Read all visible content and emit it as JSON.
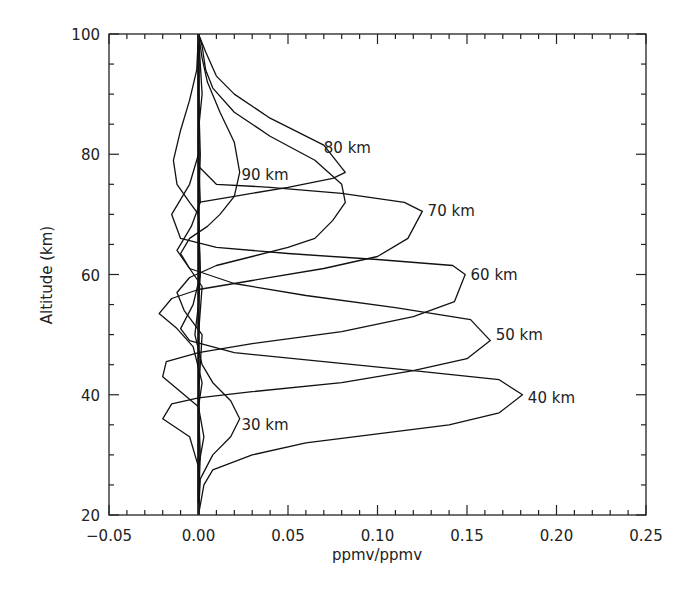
{
  "chart_data": {
    "type": "line",
    "title": "",
    "xlabel": "ppmv/ppmv",
    "ylabel": "Altitude (km)",
    "xlim": [
      -0.05,
      0.25
    ],
    "ylim": [
      20,
      100
    ],
    "grid": false,
    "legend": "none (inline curve labels)",
    "x_ticks": [
      "-0.05",
      "0.00",
      "0.05",
      "0.10",
      "0.15",
      "0.20",
      "0.25"
    ],
    "x_tick_values": [
      -0.05,
      0.0,
      0.05,
      0.1,
      0.15,
      0.2,
      0.25
    ],
    "y_ticks": [
      "20",
      "40",
      "60",
      "80",
      "100"
    ],
    "y_tick_values": [
      20,
      40,
      60,
      80,
      100
    ],
    "x_minor_step": 0.01,
    "y_minor_step": 5,
    "series": [
      {
        "name": "30 km",
        "label": "30 km",
        "label_pos": [
          0.024,
          35
        ],
        "points": [
          [
            0.0,
            20
          ],
          [
            0.001,
            26
          ],
          [
            0.008,
            30
          ],
          [
            0.018,
            33
          ],
          [
            0.023,
            36
          ],
          [
            0.018,
            39
          ],
          [
            0.008,
            42
          ],
          [
            0.002,
            45
          ],
          [
            -0.002,
            50
          ],
          [
            0.0,
            55
          ],
          [
            0.001,
            60
          ],
          [
            0.0,
            70
          ],
          [
            0.001,
            80
          ],
          [
            0.0,
            90
          ],
          [
            0.0,
            100
          ]
        ]
      },
      {
        "name": "40 km",
        "label": "40 km",
        "label_pos": [
          0.184,
          39.5
        ],
        "points": [
          [
            0.0,
            20
          ],
          [
            0.003,
            25
          ],
          [
            0.008,
            27.5
          ],
          [
            0.03,
            30
          ],
          [
            0.06,
            32
          ],
          [
            0.1,
            33.5
          ],
          [
            0.14,
            35
          ],
          [
            0.168,
            37
          ],
          [
            0.181,
            40
          ],
          [
            0.168,
            42.5
          ],
          [
            0.12,
            44
          ],
          [
            0.07,
            45.5
          ],
          [
            0.02,
            47
          ],
          [
            -0.005,
            49
          ],
          [
            -0.01,
            51
          ],
          [
            -0.003,
            55
          ],
          [
            0.001,
            60
          ],
          [
            0.0,
            70
          ],
          [
            0.0,
            80
          ],
          [
            0.0,
            100
          ]
        ]
      },
      {
        "name": "50 km",
        "label": "50 km",
        "label_pos": [
          0.166,
          50
        ],
        "points": [
          [
            0.0,
            22
          ],
          [
            0.0,
            28
          ],
          [
            -0.005,
            33
          ],
          [
            -0.02,
            36
          ],
          [
            -0.015,
            38.5
          ],
          [
            0.0,
            39.5
          ],
          [
            0.03,
            40.5
          ],
          [
            0.08,
            42
          ],
          [
            0.12,
            44
          ],
          [
            0.15,
            46
          ],
          [
            0.163,
            49
          ],
          [
            0.152,
            52.5
          ],
          [
            0.11,
            54.5
          ],
          [
            0.06,
            56.5
          ],
          [
            0.02,
            58.5
          ],
          [
            -0.005,
            61
          ],
          [
            -0.012,
            64
          ],
          [
            -0.004,
            68
          ],
          [
            0.001,
            72
          ],
          [
            0.0,
            80
          ],
          [
            0.0,
            100
          ]
        ]
      },
      {
        "name": "60 km",
        "label": "60 km",
        "label_pos": [
          0.152,
          60
        ],
        "points": [
          [
            0.0,
            22
          ],
          [
            0.0,
            28
          ],
          [
            0.003,
            33
          ],
          [
            0.0,
            38
          ],
          [
            -0.01,
            40.5
          ],
          [
            -0.02,
            43
          ],
          [
            -0.018,
            45.5
          ],
          [
            0.0,
            47
          ],
          [
            0.03,
            48.5
          ],
          [
            0.08,
            50.5
          ],
          [
            0.12,
            53
          ],
          [
            0.143,
            55.5
          ],
          [
            0.149,
            60
          ],
          [
            0.142,
            61.5
          ],
          [
            0.1,
            62.5
          ],
          [
            0.05,
            63.5
          ],
          [
            0.01,
            64.5
          ],
          [
            -0.01,
            66
          ],
          [
            -0.015,
            70
          ],
          [
            -0.005,
            75
          ],
          [
            0.0,
            80
          ],
          [
            0.0,
            100
          ]
        ]
      },
      {
        "name": "70 km",
        "label": "70 km",
        "label_pos": [
          0.128,
          70.5
        ],
        "points": [
          [
            0.0,
            22
          ],
          [
            0.001,
            30
          ],
          [
            0.0,
            38
          ],
          [
            0.002,
            42
          ],
          [
            -0.003,
            48
          ],
          [
            -0.012,
            51
          ],
          [
            -0.022,
            53.5
          ],
          [
            -0.015,
            56
          ],
          [
            0.0,
            57.5
          ],
          [
            0.03,
            59
          ],
          [
            0.07,
            61
          ],
          [
            0.1,
            63
          ],
          [
            0.117,
            66
          ],
          [
            0.125,
            70.5
          ],
          [
            0.115,
            72
          ],
          [
            0.08,
            73.5
          ],
          [
            0.04,
            74.5
          ],
          [
            0.01,
            75
          ],
          [
            0.0,
            78
          ],
          [
            0.0,
            84
          ],
          [
            0.002,
            90
          ],
          [
            0.0,
            100
          ]
        ]
      },
      {
        "name": "80 km",
        "label": "80 km",
        "label_pos": [
          0.07,
          81
        ],
        "points": [
          [
            0.0,
            22
          ],
          [
            0.0,
            40
          ],
          [
            0.002,
            50
          ],
          [
            -0.008,
            54
          ],
          [
            -0.012,
            57
          ],
          [
            -0.005,
            59.5
          ],
          [
            0.01,
            61.5
          ],
          [
            0.03,
            63
          ],
          [
            0.05,
            64.5
          ],
          [
            0.065,
            66
          ],
          [
            0.075,
            69
          ],
          [
            0.082,
            72
          ],
          [
            0.08,
            75
          ],
          [
            0.065,
            79
          ],
          [
            0.04,
            83
          ],
          [
            0.02,
            87
          ],
          [
            0.008,
            91
          ],
          [
            0.004,
            94
          ],
          [
            0.002,
            98
          ],
          [
            0.0,
            100
          ]
        ]
      },
      {
        "name": "90 km",
        "label": "90 km",
        "label_pos": [
          0.024,
          76.5
        ],
        "points": [
          [
            0.0,
            22
          ],
          [
            0.0,
            50
          ],
          [
            0.002,
            58
          ],
          [
            -0.005,
            61
          ],
          [
            -0.01,
            63.5
          ],
          [
            -0.005,
            66
          ],
          [
            0.005,
            68
          ],
          [
            0.012,
            70
          ],
          [
            0.02,
            73
          ],
          [
            0.023,
            77
          ],
          [
            0.02,
            82
          ],
          [
            0.012,
            87
          ],
          [
            0.005,
            92
          ],
          [
            0.002,
            96
          ],
          [
            0.0,
            100
          ]
        ]
      },
      {
        "name": "negative lobe 80-90",
        "label": "",
        "points": [
          [
            0.0,
            70
          ],
          [
            -0.005,
            72
          ],
          [
            -0.012,
            75
          ],
          [
            -0.014,
            79
          ],
          [
            -0.01,
            84
          ],
          [
            -0.005,
            89
          ],
          [
            -0.001,
            94
          ],
          [
            0.0,
            100
          ]
        ]
      },
      {
        "name": "upper shoulder 80 km",
        "label": "",
        "points": [
          [
            0.0,
            100
          ],
          [
            0.004,
            97
          ],
          [
            0.01,
            93
          ],
          [
            0.02,
            90
          ],
          [
            0.04,
            86
          ],
          [
            0.07,
            81.5
          ],
          [
            0.082,
            77
          ],
          [
            0.075,
            76
          ],
          [
            0.05,
            74.5
          ],
          [
            0.02,
            73
          ],
          [
            0.0,
            72
          ]
        ]
      }
    ]
  }
}
